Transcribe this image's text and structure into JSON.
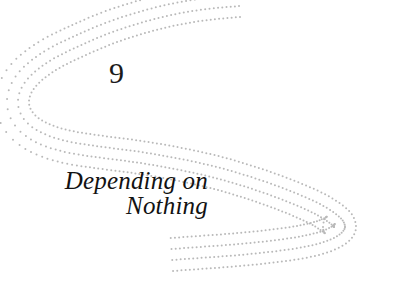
{
  "page": {
    "type": "book-chapter-opening",
    "background_color": "#ffffff",
    "width": 417,
    "height": 285
  },
  "chapter": {
    "number": "9",
    "title_lines": [
      "Depending on",
      "Nothing"
    ],
    "title_full": "Depending on Nothing",
    "number_color": "#1b1b1b",
    "title_color": "#121212"
  },
  "ornament": {
    "name": "dotted-s-curve-ornament",
    "style": "four nested parallel dotted sigmoid curves",
    "dot_color": "#b9b9b9",
    "dot_radius": 1.0,
    "dot_spacing": 4.2,
    "line_count": 4,
    "line_offsets": [
      0,
      11,
      22,
      33
    ],
    "curve_points": [
      [
        240,
        17
      ],
      [
        200,
        21
      ],
      [
        160,
        29
      ],
      [
        120,
        41
      ],
      [
        86,
        55
      ],
      [
        56,
        70
      ],
      [
        36,
        86
      ],
      [
        29,
        101
      ],
      [
        34,
        114
      ],
      [
        49,
        124
      ],
      [
        72,
        131
      ],
      [
        104,
        136
      ],
      [
        142,
        141
      ],
      [
        182,
        148
      ],
      [
        222,
        157
      ],
      [
        262,
        169
      ],
      [
        300,
        183
      ],
      [
        330,
        197
      ],
      [
        350,
        212
      ],
      [
        356,
        227
      ],
      [
        350,
        240
      ],
      [
        334,
        250
      ],
      [
        310,
        257
      ],
      [
        278,
        262
      ],
      [
        240,
        266
      ],
      [
        200,
        269
      ],
      [
        172,
        271
      ]
    ]
  }
}
